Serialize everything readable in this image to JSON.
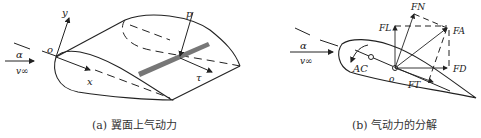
{
  "figure_a": {
    "caption": "(a) 翼面上气动力",
    "labels": {
      "alpha": "α",
      "v_inf": "v∞",
      "origin": "o",
      "y_axis": "y",
      "x_axis": "x",
      "pressure": "p",
      "shear": "τ"
    }
  },
  "figure_b": {
    "caption": "(b) 气动力的分解",
    "labels": {
      "alpha": "α",
      "v_inf": "v∞",
      "origin": "o",
      "aero_center": "AC",
      "normal_force": "FN",
      "lift": "FL",
      "resultant": "FA",
      "drag": "FD",
      "tangential_force": "FT"
    }
  },
  "colors": {
    "line": "#222222",
    "band": "#777777",
    "background": "#ffffff"
  }
}
